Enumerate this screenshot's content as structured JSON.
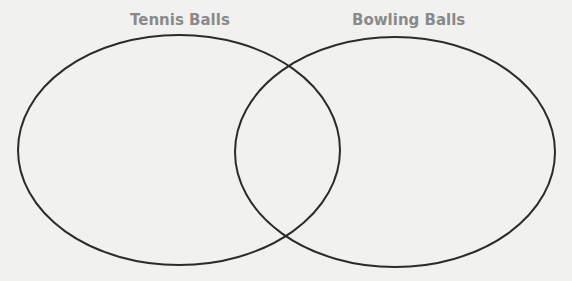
{
  "diagram": {
    "type": "venn",
    "sets": [
      {
        "label": "Tennis Balls"
      },
      {
        "label": "Bowling Balls"
      }
    ],
    "colors": {
      "outline": "#2b2b2b",
      "label": "#8a8a8a",
      "background": "#f1f1f0"
    }
  }
}
